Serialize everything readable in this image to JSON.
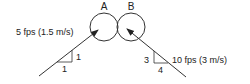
{
  "diagram": {
    "type": "two-jet vector diagram",
    "cylinders": [
      {
        "label": "A",
        "cx": 104,
        "cy": 27,
        "r": 14
      },
      {
        "label": "B",
        "cx": 131,
        "cy": 27,
        "r": 14
      }
    ],
    "jets": [
      {
        "id": "jet-a",
        "velocity_label": "5 fps (1.5 m/s)",
        "slope_rise": "1",
        "slope_run": "1",
        "from": [
          39,
          76
        ],
        "to": [
          98,
          30
        ],
        "direction": "up-right"
      },
      {
        "id": "jet-b",
        "velocity_label": "10 fps (3 m/s)",
        "slope_rise": "3",
        "slope_run": "4",
        "from": [
          186,
          77
        ],
        "to": [
          127,
          29
        ],
        "direction": "up-left"
      }
    ]
  },
  "labels": {
    "cylinder_a": "A",
    "cylinder_b": "B",
    "jet_a_velocity": "5 fps (1.5 m/s)",
    "jet_a_rise": "1",
    "jet_a_run": "1",
    "jet_b_velocity": "10 fps (3 m/s)",
    "jet_b_rise": "3",
    "jet_b_run": "4"
  },
  "colors": {
    "stroke": "#333333",
    "text": "#222222",
    "background": "#ffffff"
  }
}
